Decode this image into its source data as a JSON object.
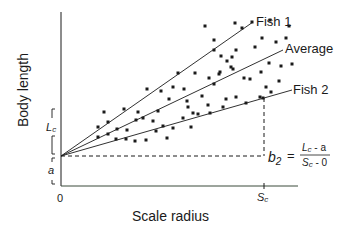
{
  "axes": {
    "y_label": "Body length",
    "x_label": "Scale radius",
    "origin_label": "0",
    "sc_label_main": "S",
    "sc_label_sub": "c",
    "lc_label_main": "L",
    "lc_label_sub": "c",
    "a_label": "a"
  },
  "lines": [
    {
      "name": "Fish 1",
      "label": "Fish 1"
    },
    {
      "name": "Average",
      "label": "Average"
    },
    {
      "name": "Fish 2",
      "label": "Fish 2"
    }
  ],
  "formula": {
    "lhs_main": "b",
    "lhs_sub": "2",
    "equals": "=",
    "num_L": "L",
    "num_c": "c",
    "num_rest": " - a",
    "den_S": "S",
    "den_c": "c",
    "den_rest": " - 0"
  },
  "colors": {
    "ink": "#1a1a1a",
    "x_axis_tint": "#3a4a3a"
  },
  "chart_data": {
    "type": "scatter",
    "title": "",
    "xlabel": "Scale radius",
    "ylabel": "Body length",
    "series": [
      {
        "name": "Fish 1",
        "kind": "line",
        "from": [
          0,
          "a"
        ],
        "slope": "steep"
      },
      {
        "name": "Average",
        "kind": "line",
        "from": [
          0,
          "a"
        ],
        "slope": "medium"
      },
      {
        "name": "Fish 2",
        "kind": "line",
        "from": [
          0,
          "a"
        ],
        "slope": "shallow (b2)"
      }
    ],
    "annotations": [
      "Lc",
      "a",
      "Sc",
      "b2 = (Lc - a)/(Sc - 0)"
    ],
    "points_px": [
      [
        104,
        112
      ],
      [
        124,
        109
      ],
      [
        138,
        112
      ],
      [
        147,
        89
      ],
      [
        161,
        91
      ],
      [
        169,
        99
      ],
      [
        173,
        87
      ],
      [
        178,
        73
      ],
      [
        184,
        89
      ],
      [
        98,
        127
      ],
      [
        108,
        122
      ],
      [
        117,
        129
      ],
      [
        127,
        130
      ],
      [
        136,
        120
      ],
      [
        143,
        118
      ],
      [
        153,
        121
      ],
      [
        158,
        111
      ],
      [
        163,
        126
      ],
      [
        98,
        137
      ],
      [
        108,
        134
      ],
      [
        116,
        139
      ],
      [
        126,
        139
      ],
      [
        135,
        141
      ],
      [
        146,
        140
      ],
      [
        156,
        131
      ],
      [
        167,
        138
      ],
      [
        173,
        128
      ],
      [
        183,
        118
      ],
      [
        191,
        127
      ],
      [
        198,
        114
      ],
      [
        208,
        105
      ],
      [
        214,
        84
      ],
      [
        220,
        72
      ],
      [
        226,
        99
      ],
      [
        233,
        69
      ],
      [
        236,
        50
      ],
      [
        187,
        101
      ],
      [
        193,
        113
      ],
      [
        202,
        96
      ],
      [
        209,
        78
      ],
      [
        214,
        50
      ],
      [
        219,
        74
      ],
      [
        221,
        56
      ],
      [
        227,
        61
      ],
      [
        231,
        67
      ],
      [
        236,
        97
      ],
      [
        244,
        78
      ],
      [
        246,
        103
      ],
      [
        250,
        79
      ],
      [
        255,
        47
      ],
      [
        260,
        97
      ],
      [
        261,
        72
      ],
      [
        262,
        38
      ],
      [
        266,
        87
      ],
      [
        269,
        63
      ],
      [
        271,
        92
      ],
      [
        276,
        42
      ],
      [
        279,
        81
      ],
      [
        281,
        66
      ],
      [
        286,
        38
      ],
      [
        292,
        64
      ],
      [
        252,
        22
      ],
      [
        235,
        23
      ],
      [
        205,
        26
      ],
      [
        214,
        40
      ],
      [
        232,
        57
      ],
      [
        263,
        98
      ],
      [
        210,
        113
      ],
      [
        188,
        107
      ],
      [
        223,
        107
      ],
      [
        195,
        73
      ],
      [
        242,
        28
      ],
      [
        270,
        20
      ],
      [
        289,
        26
      ]
    ]
  }
}
